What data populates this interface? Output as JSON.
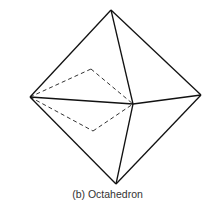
{
  "figure": {
    "caption": "(b) Octahedron",
    "vertices": {
      "top": [
        111,
        10
      ],
      "left": [
        30,
        97
      ],
      "right": [
        201,
        95
      ],
      "front": [
        133,
        104
      ],
      "bottom": [
        116,
        184
      ],
      "back_upper": [
        91,
        69
      ],
      "back_lower": [
        93,
        131
      ]
    },
    "edge_color": "#111111",
    "hidden_edge_style": "dashed"
  }
}
